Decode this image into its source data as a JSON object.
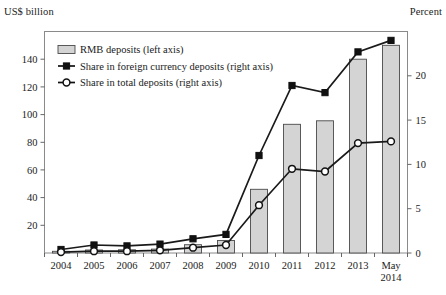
{
  "chart_data": {
    "type": "bar",
    "title": "",
    "subtitle": "",
    "left_axis_title": "US$ billion",
    "right_axis_title": "Percent",
    "xlabel": "",
    "categories": [
      "2004",
      "2005",
      "2006",
      "2007",
      "2008",
      "2009",
      "2010",
      "2011",
      "2012",
      "2013",
      "May\n2014"
    ],
    "category_labels": [
      {
        "line1": "2004",
        "line2": ""
      },
      {
        "line1": "2005",
        "line2": ""
      },
      {
        "line1": "2006",
        "line2": ""
      },
      {
        "line1": "2007",
        "line2": ""
      },
      {
        "line1": "2008",
        "line2": ""
      },
      {
        "line1": "2009",
        "line2": ""
      },
      {
        "line1": "2010",
        "line2": ""
      },
      {
        "line1": "2011",
        "line2": ""
      },
      {
        "line1": "2012",
        "line2": ""
      },
      {
        "line1": "2013",
        "line2": ""
      },
      {
        "line1": "May",
        "line2": "2014"
      }
    ],
    "ylim": [
      0,
      160
    ],
    "ylim_right": [
      0,
      25
    ],
    "yticks": [
      20,
      40,
      60,
      80,
      100,
      120,
      140
    ],
    "yticks_right": [
      0,
      5,
      10,
      15,
      20
    ],
    "grid": false,
    "legend_position": "top-left",
    "series": [
      {
        "name": "RMB deposits (left axis)",
        "type": "bar",
        "axis": "left",
        "unit": "US$ billion",
        "fill": "#d4d4d4",
        "stroke": "#4a4a4a",
        "values": [
          1.2,
          2.2,
          2.3,
          2.8,
          6.0,
          9.0,
          46.0,
          93.0,
          95.5,
          140.0,
          150.0
        ]
      },
      {
        "name": "Share in foreign currency deposits (right axis)",
        "type": "line",
        "axis": "right",
        "unit": "Percent",
        "marker": "filled-square",
        "stroke": "#1a1a1a",
        "values": [
          0.4,
          0.9,
          0.8,
          1.0,
          1.6,
          2.1,
          11.0,
          18.9,
          18.1,
          22.7,
          24.0
        ]
      },
      {
        "name": "Share in total deposits (right axis)",
        "type": "line",
        "axis": "right",
        "unit": "Percent",
        "marker": "open-circle",
        "stroke": "#1a1a1a",
        "values": [
          0.1,
          0.2,
          0.2,
          0.3,
          0.6,
          0.9,
          5.4,
          9.5,
          9.2,
          12.4,
          12.6
        ]
      }
    ]
  },
  "legend": {
    "items": [
      {
        "label": "RMB deposits (left axis)",
        "marker": "bar-swatch"
      },
      {
        "label": "Share in foreign currency deposits (right axis)",
        "marker": "filled-square"
      },
      {
        "label": "Share in total deposits (right axis)",
        "marker": "open-circle"
      }
    ]
  },
  "colors": {
    "bar_fill": "#d4d4d4",
    "bar_stroke": "#4a4a4a",
    "line": "#1a1a1a",
    "frame": "#7a7a7a",
    "text": "#1a1a1a"
  }
}
